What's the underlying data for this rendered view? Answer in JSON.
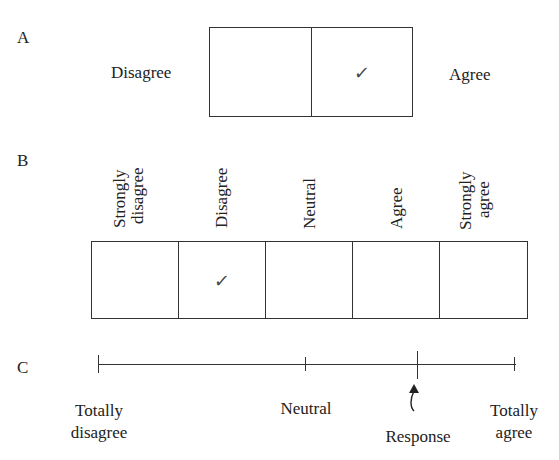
{
  "section_a": {
    "letter": "A",
    "left_label": "Disagree",
    "right_label": "Agree",
    "cells": [
      {
        "checked": false
      },
      {
        "checked": true
      }
    ],
    "check_glyph": "✓"
  },
  "section_b": {
    "letter": "B",
    "options": [
      {
        "line1": "Strongly",
        "line2": "disagree",
        "checked": false
      },
      {
        "line1": "Disagree",
        "line2": "",
        "checked": true
      },
      {
        "line1": "Neutral",
        "line2": "",
        "checked": false
      },
      {
        "line1": "Agree",
        "line2": "",
        "checked": false
      },
      {
        "line1": "Strongly",
        "line2": "agree",
        "checked": false
      }
    ],
    "check_glyph": "✓"
  },
  "section_c": {
    "letter": "C",
    "left_label_line1": "Totally",
    "left_label_line2": "disagree",
    "middle_label": "Neutral",
    "response_label": "Response",
    "right_label_line1": "Totally",
    "right_label_line2": "agree",
    "response_position_percent": 76
  }
}
